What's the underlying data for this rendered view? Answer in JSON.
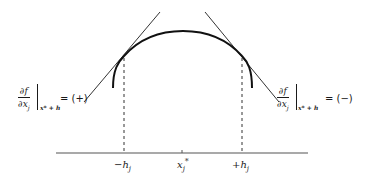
{
  "diagram": {
    "left_label": {
      "numerator": "∂f",
      "denominator": "∂x",
      "denominator_sub": "j",
      "eval_at": "x* + h",
      "equals": "= (+)"
    },
    "right_label": {
      "numerator": "∂f",
      "denominator": "∂x",
      "denominator_sub": "j",
      "eval_at": "x* + h",
      "equals": "= (−)"
    },
    "axis_ticks": [
      {
        "label": "−h",
        "sub": "j"
      },
      {
        "label": "x",
        "sub": "j",
        "sup": "*"
      },
      {
        "label": "+h",
        "sub": "j"
      }
    ],
    "colors": {
      "ink": "#1a1a1a",
      "background": "#ffffff"
    }
  }
}
